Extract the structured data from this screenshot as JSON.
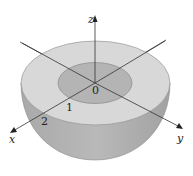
{
  "figure": {
    "type": "3D solid hemispherical shell (cutaway view)",
    "axes": {
      "x": {
        "label": "x"
      },
      "y": {
        "label": "y"
      },
      "z": {
        "label": "z"
      }
    },
    "origin_label": "0",
    "radius_labels": {
      "inner": "1",
      "outer": "2"
    },
    "colors": {
      "top_ring": "#d9d9d9",
      "inner_disk": "#b5b5b5",
      "bowl": "#a8a8a8",
      "bowl_highlight": "#c4c4c4",
      "axis": "#333333",
      "edge": "#888888"
    }
  }
}
